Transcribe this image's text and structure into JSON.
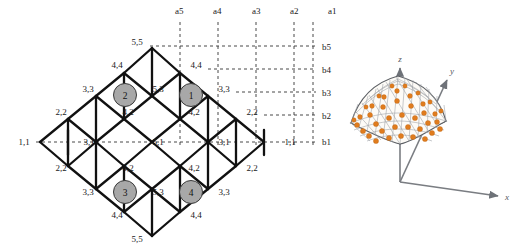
{
  "figure": {
    "colors": {
      "line": "#111111",
      "dashed": "#2b2b2b",
      "node_fill": "#a8a8a8",
      "node_stroke": "#3a3a3a",
      "text": "#1a1a1a",
      "shell_node": "#e07c1e",
      "shell_mesh": "#8c8f94",
      "axis_3d": "#6e7278",
      "background": "#ffffff"
    }
  },
  "left_diagram": {
    "name": "plan-lattice",
    "column_guides": [
      "a5",
      "a4",
      "a3",
      "a2",
      "a1"
    ],
    "row_guides": [
      "b5",
      "b4",
      "b3",
      "b2",
      "b1"
    ],
    "highlighted_nodes": [
      "2",
      "1",
      "3",
      "4"
    ],
    "node_labels": {
      "row_top": [
        "5,5"
      ],
      "row_2": [
        "4,4",
        "4,4"
      ],
      "row_3": [
        "3,3",
        "5,3",
        "3,3"
      ],
      "row_4": [
        "2,2",
        "4,2",
        "4,2",
        "2,2"
      ],
      "row_5": [
        "1,1",
        "3,1",
        "5,1",
        "3,1",
        "1,1"
      ],
      "row_6": [
        "2,2",
        "4,2",
        "4,2",
        "2,2"
      ],
      "row_7": [
        "3,3",
        "5,3",
        "3,3"
      ],
      "row_8": [
        "4,4",
        "4,4"
      ],
      "row_bottom": [
        "5,5"
      ]
    },
    "labels": [
      {
        "text": "a5",
        "x": 175,
        "y": 14
      },
      {
        "text": "a4",
        "x": 213,
        "y": 14
      },
      {
        "text": "a3",
        "x": 252,
        "y": 14
      },
      {
        "text": "a2",
        "x": 290,
        "y": 14
      },
      {
        "text": "a1",
        "x": 328,
        "y": 14
      },
      {
        "text": "b5",
        "x": 322,
        "y": 50
      },
      {
        "text": "b4",
        "x": 322,
        "y": 73
      },
      {
        "text": "b3",
        "x": 322,
        "y": 96
      },
      {
        "text": "b2",
        "x": 322,
        "y": 119
      },
      {
        "text": "b1",
        "x": 322,
        "y": 145
      },
      {
        "text": "5,5",
        "x": 137,
        "y": 48
      },
      {
        "text": "4,4",
        "x": 117,
        "y": 71
      },
      {
        "text": "4,4",
        "x": 194,
        "y": 71
      },
      {
        "text": "3,3",
        "x": 88,
        "y": 94
      },
      {
        "text": "5,3",
        "x": 156,
        "y": 94
      },
      {
        "text": "3,3",
        "x": 222,
        "y": 94
      },
      {
        "text": "2,2",
        "x": 61,
        "y": 117
      },
      {
        "text": "4,2",
        "x": 127,
        "y": 117
      },
      {
        "text": "4,2",
        "x": 194,
        "y": 117
      },
      {
        "text": "2,2",
        "x": 250,
        "y": 117
      },
      {
        "text": "1,1",
        "x": 22,
        "y": 145
      },
      {
        "text": "3,1",
        "x": 89,
        "y": 145
      },
      {
        "text": "5,1",
        "x": 156,
        "y": 145
      },
      {
        "text": "3,1",
        "x": 222,
        "y": 145
      },
      {
        "text": "1,1",
        "x": 289,
        "y": 145
      },
      {
        "text": "2,2",
        "x": 61,
        "y": 169
      },
      {
        "text": "4,2",
        "x": 127,
        "y": 169
      },
      {
        "text": "4,2",
        "x": 194,
        "y": 169
      },
      {
        "text": "2,2",
        "x": 250,
        "y": 169
      },
      {
        "text": "3,3",
        "x": 88,
        "y": 192
      },
      {
        "text": "5,3",
        "x": 156,
        "y": 192
      },
      {
        "text": "3,3",
        "x": 222,
        "y": 192
      },
      {
        "text": "4,4",
        "x": 117,
        "y": 215
      },
      {
        "text": "4,4",
        "x": 194,
        "y": 215
      },
      {
        "text": "5,5",
        "x": 137,
        "y": 238
      }
    ],
    "circles": [
      {
        "label": "2",
        "cx": 125,
        "cy": 95
      },
      {
        "label": "1",
        "cx": 191,
        "cy": 95
      },
      {
        "label": "3",
        "cx": 125,
        "cy": 192
      },
      {
        "label": "4",
        "cx": 191,
        "cy": 192
      }
    ]
  },
  "right_figure": {
    "name": "shell-3d",
    "axis_labels": [
      {
        "text": "z",
        "x": 400,
        "y": 62
      },
      {
        "text": "y",
        "x": 452,
        "y": 74
      },
      {
        "text": "x",
        "x": 505,
        "y": 200
      }
    ]
  }
}
